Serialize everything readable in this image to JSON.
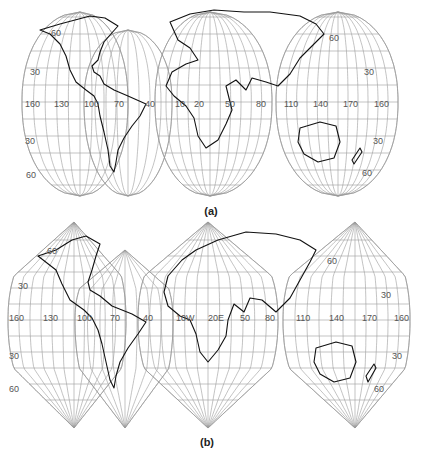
{
  "figure": {
    "panels": [
      {
        "id": "a",
        "caption": "(a)",
        "projection": "interrupted homolosine-style, rounded lobes",
        "meridian_labels": [
          "160",
          "130",
          "100",
          "70",
          "40",
          "10",
          "20",
          "50",
          "80",
          "110",
          "140",
          "170",
          "160"
        ],
        "parallel_labels_left": [
          "60",
          "30",
          "30",
          "60"
        ],
        "parallel_labels_right": [
          "60",
          "30",
          "30",
          "60"
        ]
      },
      {
        "id": "b",
        "caption": "(b)",
        "projection": "interrupted, pointed polar lobes",
        "meridian_labels": [
          "160",
          "130",
          "100",
          "70",
          "40",
          "10W",
          "20E",
          "50",
          "80",
          "110",
          "140",
          "170",
          "160"
        ],
        "parallel_labels_left": [
          "60",
          "30",
          "30",
          "60"
        ],
        "parallel_labels_right": [
          "60",
          "30",
          "30",
          "60"
        ]
      }
    ],
    "colors": {
      "grid": "#9a9a9a",
      "coast": "#111111",
      "background": "#ffffff"
    }
  }
}
